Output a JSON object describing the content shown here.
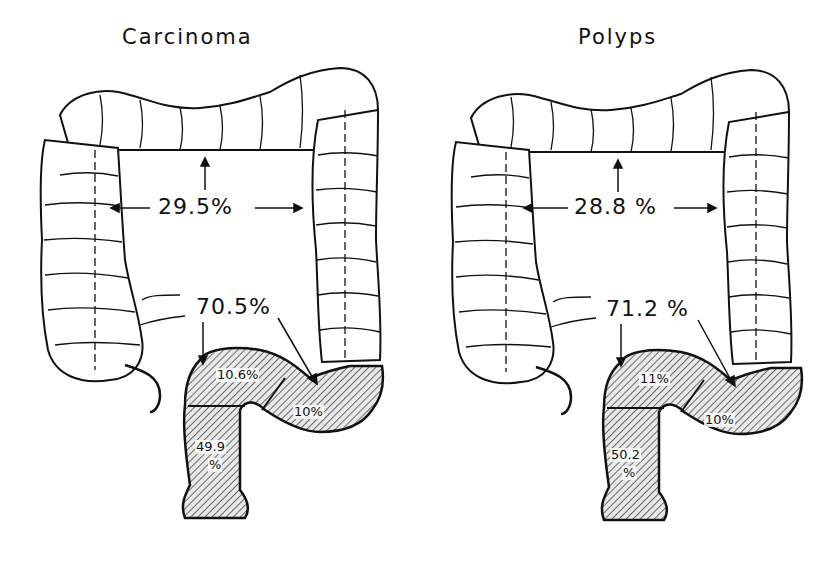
{
  "panels": [
    {
      "title": "Carcinoma",
      "proximal_label": "29.5%",
      "distal_label": "70.5%",
      "segments": {
        "sigmoid": "10.6%",
        "rectum_value": "49.9",
        "rectum_unit": "%",
        "descending_junction": "10%"
      }
    },
    {
      "title": "Polyps",
      "proximal_label": "28.8 %",
      "distal_label": "71.2 %",
      "segments": {
        "sigmoid": "11%",
        "rectum_value": "50.2",
        "rectum_unit": "%",
        "descending_junction": "10%"
      }
    }
  ],
  "colors": {
    "ink": "#111111",
    "background": "#ffffff",
    "hatch": "#333333"
  }
}
